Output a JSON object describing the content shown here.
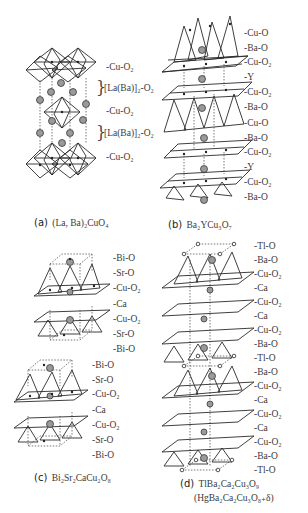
{
  "panels": {
    "a": {
      "tag": "(a)",
      "formula": "(La, Ba)₂CuO₄",
      "layers": [
        "-Cu-O₂",
        "[La(Ba)]₂-O₂",
        "-Cu-O₂",
        "[La(Ba)]₂-O₂",
        "-Cu-O₂"
      ]
    },
    "b": {
      "tag": "(b)",
      "formula": "Ba₂YCu₃O₇",
      "layers": [
        "-Cu-O",
        "-Ba-O",
        "-Cu-O₂",
        "-Y",
        "-Cu-O₂",
        "-Ba-O",
        "-Cu-O",
        "-Ba-O",
        "-Cu-O₂",
        "-Y",
        "-Cu-O₂",
        "-Ba-O"
      ]
    },
    "c": {
      "tag": "(c)",
      "formula": "Bi₂Sr₂CaCu₂O₈",
      "layers": [
        "-Bi-O",
        "-Sr-O",
        "-Cu-O₂",
        "-Ca",
        "-Cu-O₂",
        "-Sr-O",
        "-Bi-O",
        "-Bi-O",
        "-Sr-O",
        "-Cu-O₂",
        "-Ca",
        "-Cu-O₂",
        "-Sr-O",
        "-Bi-O"
      ]
    },
    "d": {
      "tag": "(d)",
      "formula": "TlBa₂Ca₂Cu₃O₉",
      "formula_alt": "(HgBa₂Ca₂Cu₃O₈₊δ)",
      "layers": [
        "-Tl-O",
        "-Ba-O",
        "-Cu-O₂",
        "-Ca",
        "-Cu-O₂",
        "-Ca",
        "-Cu-O₂",
        "-Ba-O",
        "-Tl-O",
        "-Ba-O",
        "-Cu-O₂",
        "-Ca",
        "-Cu-O₂",
        "-Ca",
        "-Cu-O₂",
        "-Ba-O",
        "-Tl-O"
      ]
    }
  },
  "colors": {
    "line": "#2a2a2a",
    "dotted": "#555555",
    "atom_fill": "#9a9a9a",
    "text": "#3a3a3a"
  }
}
